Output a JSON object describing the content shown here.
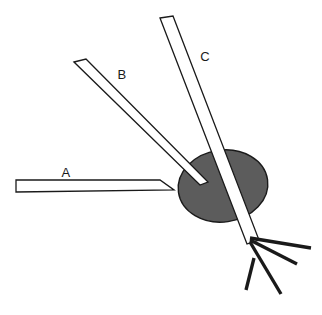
{
  "figure": {
    "background_color": "#ffffff",
    "width": 322,
    "height": 315,
    "line_color": "#1a1a1a",
    "fill_color": "#5c5c5c"
  },
  "labels": [
    {
      "id": "A",
      "text": "A",
      "x": 66,
      "y": 177
    },
    {
      "id": "B",
      "text": "B",
      "x": 122,
      "y": 79
    },
    {
      "id": "C",
      "text": "C",
      "x": 205,
      "y": 61
    }
  ],
  "target": {
    "name": "shaded-ellipse",
    "cx": 223,
    "cy": 186,
    "rx": 45,
    "ry": 36,
    "rotation": -8,
    "fill": "#5c5c5c",
    "stroke": "#1a1a1a"
  },
  "instruments": [
    {
      "id": "A",
      "name": "horizontal-arrow-a",
      "kind": "arrow",
      "outline": "16,180 160,180 174,190 16,192",
      "tip": {
        "x": 174,
        "y": 190
      }
    },
    {
      "id": "B",
      "name": "needle-b",
      "kind": "needle",
      "outline": "74,62 86,59 207,181 199,184",
      "tip": {
        "x": 205,
        "y": 182
      }
    },
    {
      "id": "C",
      "name": "needle-c",
      "kind": "needle",
      "outline": "160,18 173,16 258,240 247,243",
      "tip": {
        "x": 253,
        "y": 242
      }
    }
  ],
  "fan_lines": [
    {
      "name": "fan-line-1",
      "x1": 250,
      "y1": 238,
      "x2": 311,
      "y2": 248
    },
    {
      "name": "fan-line-2",
      "x1": 250,
      "y1": 240,
      "x2": 297,
      "y2": 264
    },
    {
      "name": "fan-line-3",
      "x1": 250,
      "y1": 242,
      "x2": 281,
      "y2": 294
    },
    {
      "name": "fan-line-4",
      "x1": 254,
      "y1": 258,
      "x2": 246,
      "y2": 290
    }
  ]
}
